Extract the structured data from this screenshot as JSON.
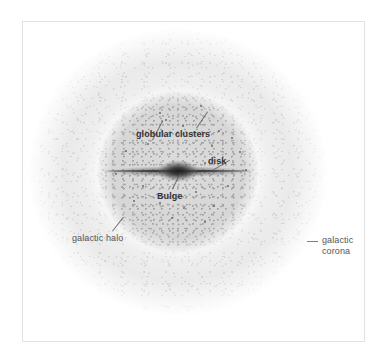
{
  "figure": {
    "background_color": "#ffffff",
    "frame_color": "#e2e2e2",
    "ink_color": "#3d3d3d"
  },
  "labels": {
    "globular_clusters": "globular clusters",
    "disk": "disk",
    "bulge": "Bulge",
    "galactic_halo": "galactic halo",
    "galactic_corona_line1": "galactic",
    "galactic_corona_line2": "corona"
  },
  "components": [
    {
      "name": "galactic corona",
      "shape": "diffuse speckled outer sphere",
      "center": [
        178,
        172
      ],
      "radius": 150
    },
    {
      "name": "galactic halo",
      "shape": "speckled sphere",
      "center": [
        178,
        172
      ],
      "radius": 83
    },
    {
      "name": "disk",
      "shape": "thin edge-on lens",
      "center": [
        178,
        171
      ],
      "half_length": 73
    },
    {
      "name": "Bulge",
      "shape": "dark central ellipse",
      "center": [
        178,
        171
      ],
      "width": 42,
      "height": 22
    },
    {
      "name": "globular clusters",
      "shape": "scattered point sources",
      "count": 22
    }
  ],
  "globular_cluster_points": [
    [
      201,
      106
    ],
    [
      160,
      113
    ],
    [
      183,
      126
    ],
    [
      219,
      131
    ],
    [
      232,
      138
    ],
    [
      148,
      144
    ],
    [
      212,
      146
    ],
    [
      240,
      152
    ],
    [
      126,
      151
    ],
    [
      166,
      120
    ],
    [
      205,
      163
    ],
    [
      143,
      186
    ],
    [
      196,
      192
    ],
    [
      228,
      186
    ],
    [
      160,
      203
    ],
    [
      184,
      208
    ],
    [
      214,
      206
    ],
    [
      134,
      201
    ],
    [
      246,
      170
    ],
    [
      116,
      174
    ],
    [
      172,
      218
    ],
    [
      205,
      222
    ]
  ]
}
